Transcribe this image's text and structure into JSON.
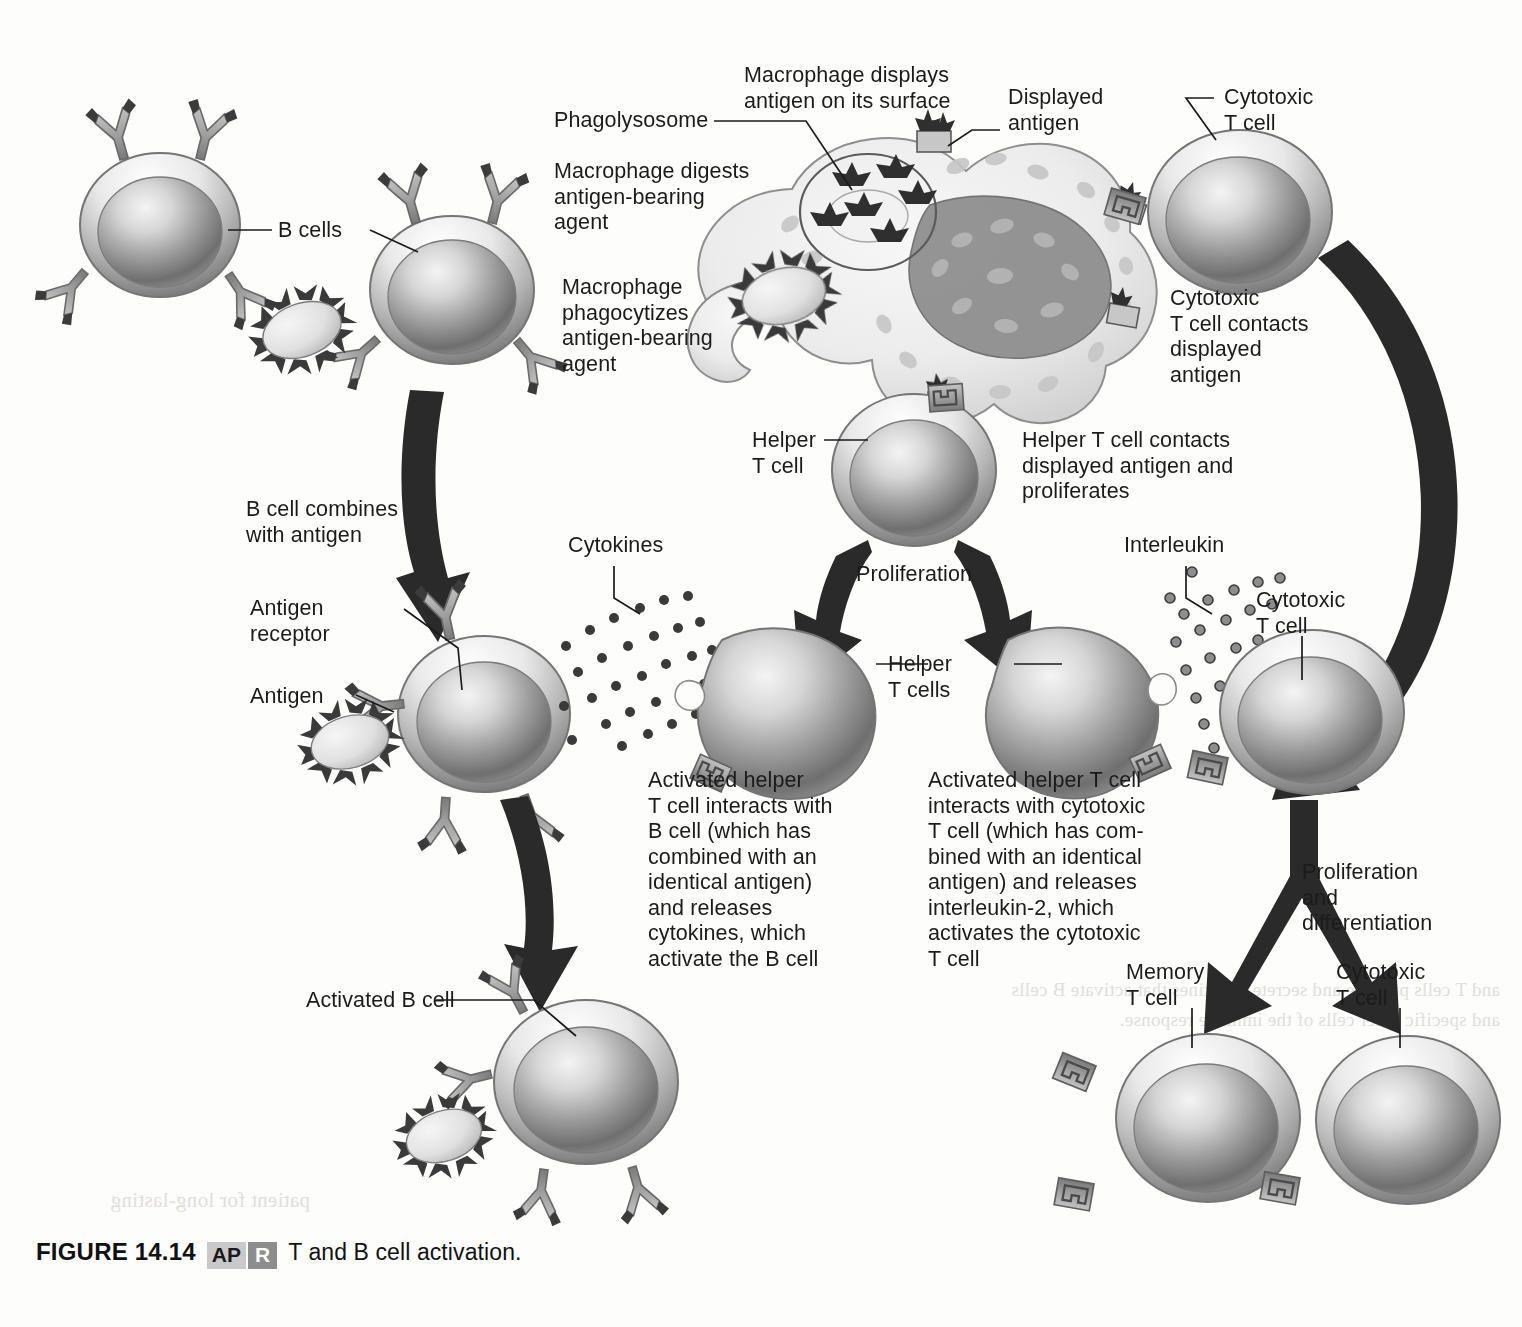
{
  "figure": {
    "number": "FIGURE 14.14",
    "badge_ap": "AP",
    "badge_r": "R",
    "title": "T and B cell activation."
  },
  "labels": {
    "b_cells": "B cells",
    "phagolysosome": "Phagolysosome",
    "macrophage_digests": "Macrophage digests\nantigen-bearing\nagent",
    "macrophage_phagocytizes": "Macrophage\nphagocytizes\nantigen-bearing\nagent",
    "macrophage_displays": "Macrophage displays\nantigen on its surface",
    "displayed_antigen": "Displayed\nantigen",
    "cytotoxic_t_cell_top": "Cytotoxic\nT cell",
    "cytotoxic_contacts": "Cytotoxic\nT cell contacts\ndisplayed\nantigen",
    "helper_t_cell": "Helper\nT cell",
    "helper_contacts": "Helper T cell contacts\ndisplayed antigen and\nproliferates",
    "b_cell_combines": "B cell combines\nwith antigen",
    "antigen_receptor": "Antigen\nreceptor",
    "antigen": "Antigen",
    "cytokines": "Cytokines",
    "proliferation": "Proliferation",
    "interleukin": "Interleukin",
    "helper_t_cells": "Helper\nT cells",
    "cytotoxic_t_cell_mid": "Cytotoxic\nT cell",
    "activated_helper_b": "Activated helper\nT cell interacts with\nB cell (which has\ncombined with an\nidentical  antigen)\nand releases\ncytokines, which\nactivate the B cell",
    "activated_helper_c": "Activated helper T cell\ninteracts with cytotoxic\nT cell (which has com-\nbined with an identical\nantigen) and releases\ninterleukin-2, which\nactivates the cytotoxic\nT cell",
    "proliferation_differentiation": "Proliferation\nand\ndifferentiation",
    "activated_b_cell": "Activated B cell",
    "memory_t_cell": "Memory\nT cell",
    "cytotoxic_t_cell_bottom": "Cytotoxic\nT cell"
  },
  "ghost_text": {
    "block_right": "and T cells produce and secrete cytokines\nthat activate B cells and specific other\ncells of the immune response.",
    "block_left": "patient for\nlong-lasting"
  },
  "colors": {
    "page_background": "#fdfdfc",
    "text": "#1b1b1b",
    "arrow": "#2a2a2a",
    "cell_outline": "#6e6e6e",
    "cell_light": "#efefef",
    "cell_mid": "#a8a8a8",
    "cell_dark": "#5d5d5d",
    "receptor": "#9a9a9a",
    "antigen_fill": "#e3e3e3",
    "macrophage_fill": "#ededed",
    "badge_ap_bg": "#c9c9c9",
    "badge_r_bg": "#8d8d8d"
  }
}
